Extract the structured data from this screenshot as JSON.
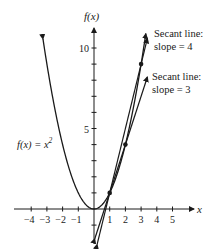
{
  "chart_data": {
    "type": "line",
    "title": "",
    "xlabel": "x",
    "ylabel": "f(x)",
    "xlim": [
      -4.6,
      6
    ],
    "ylim": [
      -2.2,
      11.8
    ],
    "grid": false,
    "x_ticks": [
      -4,
      -3,
      -2,
      -1,
      1,
      2,
      3,
      4,
      5
    ],
    "x_tick_labels": [
      "−4",
      "−3",
      "−2",
      "−1",
      "1",
      "2",
      "3",
      "4",
      "5"
    ],
    "y_ticks": [
      -1,
      1,
      2,
      3,
      4,
      5,
      6,
      7,
      8,
      9,
      10
    ],
    "y_tick_labels": [
      {
        "value": 5,
        "label": "5"
      },
      {
        "value": 10,
        "label": "10"
      }
    ],
    "series": [
      {
        "name": "f(x) = x^2",
        "kind": "curve",
        "function": "x^2",
        "x_range": [
          -3.25,
          0.95
        ]
      },
      {
        "name": "Secant line: slope = 4",
        "kind": "line",
        "through": [
          [
            1,
            1
          ],
          [
            3,
            9
          ]
        ],
        "slope": 4,
        "x_range": [
          0.2,
          3.4
        ]
      },
      {
        "name": "Secant line: slope = 3",
        "kind": "line",
        "through": [
          [
            1,
            1
          ],
          [
            2,
            4
          ]
        ],
        "slope": 3,
        "x_range": [
          0.05,
          3.4
        ]
      },
      {
        "name": "curve continuation",
        "kind": "curve",
        "function": "x^2",
        "x_range": [
          0.95,
          3.3
        ]
      }
    ],
    "points": [
      [
        1,
        1
      ],
      [
        2,
        4
      ],
      [
        3,
        9
      ]
    ],
    "annotations": [
      {
        "text_line1": "Secant line:",
        "text_line2": "slope = 4"
      },
      {
        "text_line1": "Secant line:",
        "text_line2": "slope = 3"
      },
      {
        "text": "f(x) = x²"
      }
    ]
  },
  "labels": {
    "y_axis": "f(x)",
    "x_axis": "x",
    "y10": "10",
    "y5": "5",
    "func_label_f": "f(x) = x",
    "func_label_exp": "2",
    "secant4_l1": "Secant line:",
    "secant4_l2": "slope = 4",
    "secant3_l1": "Secant line:",
    "secant3_l2": "slope = 3",
    "xticks": [
      "−4",
      "−3",
      "−2",
      "−1",
      "1",
      "2",
      "3",
      "4",
      "5"
    ]
  },
  "colors": {
    "ink": "#1a1a1a",
    "background": "#ffffff"
  }
}
